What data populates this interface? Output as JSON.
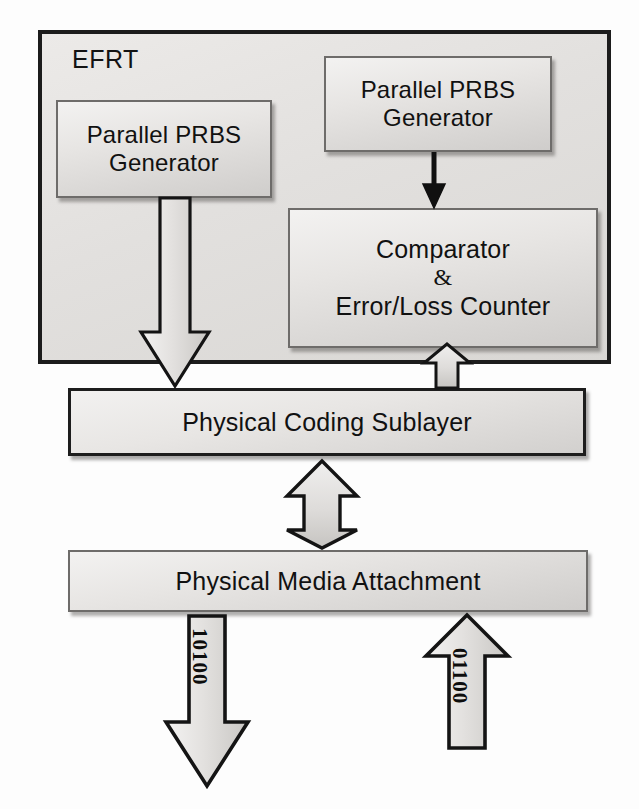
{
  "diagram": {
    "container": {
      "label": "EFRT"
    },
    "blocks": [
      {
        "id": "prbs-left",
        "name": "parallel-prbs-generator-tx",
        "lines": [
          "Parallel PRBS",
          "Generator"
        ]
      },
      {
        "id": "prbs-right",
        "name": "parallel-prbs-generator-rx",
        "lines": [
          "Parallel PRBS",
          "Generator"
        ]
      },
      {
        "id": "comparator",
        "name": "comparator-error-loss-counter",
        "lines": [
          "Comparator",
          "&",
          "Error/Loss Counter"
        ]
      },
      {
        "id": "pcs",
        "name": "physical-coding-sublayer",
        "lines": [
          "Physical Coding Sublayer"
        ]
      },
      {
        "id": "pma",
        "name": "physical-media-attachment",
        "lines": [
          "Physical Media Attachment"
        ]
      }
    ],
    "block_text": {
      "prbs_left_line1": "Parallel PRBS",
      "prbs_left_line2": "Generator",
      "prbs_right_line1": "Parallel PRBS",
      "prbs_right_line2": "Generator",
      "comparator_line1": "Comparator",
      "comparator_line2": "&",
      "comparator_line3": "Error/Loss Counter",
      "pcs_label": "Physical Coding Sublayer",
      "pma_label": "Physical Media Attachment"
    },
    "arrows": [
      {
        "name": "arrow-prbs-left-to-pcs",
        "direction": "down",
        "style": "hollow-block",
        "from": "Parallel PRBS Generator (TX)",
        "to": "Physical Coding Sublayer"
      },
      {
        "name": "arrow-prbs-right-to-comparator",
        "direction": "down",
        "style": "solid-thin",
        "from": "Parallel PRBS Generator (RX)",
        "to": "Comparator & Error/Loss Counter"
      },
      {
        "name": "arrow-pcs-to-comparator",
        "direction": "up",
        "style": "hollow-block",
        "from": "Physical Coding Sublayer",
        "to": "Comparator & Error/Loss Counter"
      },
      {
        "name": "arrow-pcs-pma-bidirectional",
        "direction": "bidirectional-vertical",
        "style": "hollow-block",
        "from": "Physical Coding Sublayer",
        "to": "Physical Media Attachment"
      },
      {
        "name": "arrow-pma-transmit",
        "direction": "down",
        "style": "hollow-block",
        "from": "Physical Media Attachment",
        "to": "medium",
        "label": "10100"
      },
      {
        "name": "arrow-pma-receive",
        "direction": "up",
        "style": "hollow-block",
        "from": "medium",
        "to": "Physical Media Attachment",
        "label": "01100"
      }
    ],
    "bit_labels": {
      "transmit": "10100",
      "receive": "01100"
    },
    "colors": {
      "outline": "#1c1c1c",
      "block_fill_light": "#f2f1f0",
      "block_fill_dark": "#d0cecb",
      "container_fill": "#e4e2e0",
      "text": "#111111",
      "arrow_fill": "#d6d4d1",
      "arrow_stroke": "#141414"
    }
  }
}
